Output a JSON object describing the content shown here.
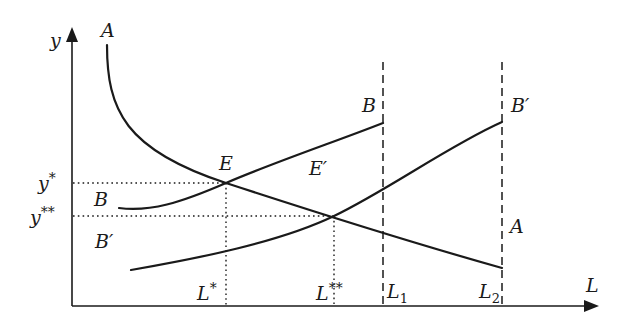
{
  "diagram": {
    "axes": {
      "x_label": "L",
      "y_label": "y"
    },
    "curves": {
      "A": {
        "label_top": "A",
        "label_right": "A"
      },
      "B": {
        "label_left": "B",
        "label_right": "B"
      },
      "B_prime": {
        "label_left": "B′",
        "label_right": "B′"
      }
    },
    "points": {
      "E": "E",
      "E_prime": "E′"
    },
    "y_ticks": {
      "y_star": {
        "base": "y",
        "sup": "*"
      },
      "y_double_star": {
        "base": "y",
        "sup": "**"
      }
    },
    "x_ticks": {
      "L_star": {
        "base": "L",
        "sup": "*"
      },
      "L_double_star": {
        "base": "L",
        "sup": "**"
      },
      "L1": {
        "base": "L",
        "sub": "1"
      },
      "L2": {
        "base": "L",
        "sub": "2"
      }
    }
  }
}
